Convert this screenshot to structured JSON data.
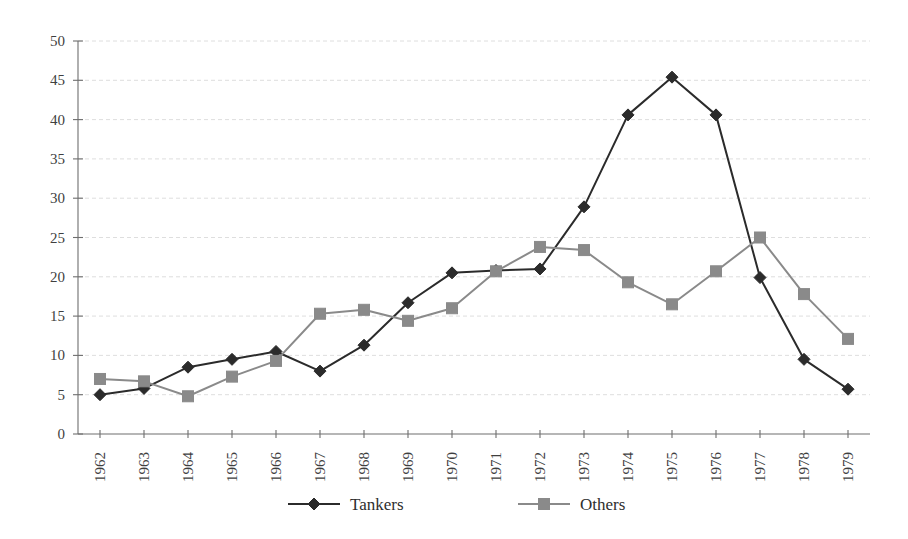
{
  "chart_data": {
    "type": "line",
    "title": "",
    "subtitle": "",
    "xlabel": "",
    "ylabel": "",
    "categories": [
      "1962",
      "1963",
      "1964",
      "1965",
      "1966",
      "1967",
      "1968",
      "1969",
      "1970",
      "1971",
      "1972",
      "1973",
      "1974",
      "1975",
      "1976",
      "1977",
      "1978",
      "1979"
    ],
    "series": [
      {
        "name": "Tankers",
        "marker": "diamond",
        "color": "#2b2b2b",
        "values": [
          5.0,
          5.8,
          8.5,
          9.5,
          10.5,
          8.0,
          11.3,
          16.7,
          20.5,
          20.8,
          21.0,
          28.9,
          40.6,
          45.4,
          40.6,
          19.9,
          9.5,
          5.7
        ]
      },
      {
        "name": "Others",
        "marker": "square",
        "color": "#8a8a8a",
        "values": [
          7.0,
          6.7,
          4.8,
          7.3,
          9.3,
          15.3,
          15.8,
          14.4,
          16.0,
          20.7,
          23.8,
          23.4,
          19.3,
          16.5,
          20.7,
          25.0,
          17.8,
          12.1
        ]
      }
    ],
    "yticks": [
      0,
      5,
      10,
      15,
      20,
      25,
      30,
      35,
      40,
      45,
      50
    ],
    "ylim": [
      0,
      50
    ],
    "grid": true,
    "grid_axis": "y",
    "legend_position": "bottom"
  },
  "axis": {
    "y_tick_labels": [
      "0",
      "5",
      "10",
      "15",
      "20",
      "25",
      "30",
      "35",
      "40",
      "45",
      "50"
    ],
    "x_tick_labels": [
      "1962",
      "1963",
      "1964",
      "1965",
      "1966",
      "1967",
      "1968",
      "1969",
      "1970",
      "1971",
      "1972",
      "1973",
      "1974",
      "1975",
      "1976",
      "1977",
      "1978",
      "1979"
    ]
  },
  "legend": {
    "items": [
      {
        "label": "Tankers",
        "marker": "diamond-marker-icon",
        "color": "#2b2b2b"
      },
      {
        "label": "Others",
        "marker": "square-marker-icon",
        "color": "#8a8a8a"
      }
    ]
  },
  "colors": {
    "tankers": "#2b2b2b",
    "others": "#8a8a8a",
    "axis": "#6e6e6e",
    "grid": "#cfcfcf",
    "background": "#ffffff"
  }
}
